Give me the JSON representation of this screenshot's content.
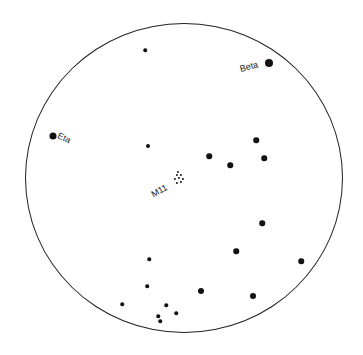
{
  "chart_data": {
    "type": "scatter",
    "title": "",
    "field_circle": {
      "cx": 184,
      "cy": 178,
      "rx": 159,
      "ry": 155
    },
    "labels": [
      {
        "text": "Beta",
        "x": 240,
        "y": 70,
        "rotate": -15
      },
      {
        "text": "Eta",
        "x": 58,
        "y": 136,
        "rotate": 25
      },
      {
        "text": "M11",
        "x": 152,
        "y": 196,
        "rotate": -30
      }
    ],
    "stars": [
      {
        "x": 145,
        "y": 50,
        "size": 3.5
      },
      {
        "x": 269,
        "y": 63,
        "size": 8
      },
      {
        "x": 53,
        "y": 136,
        "size": 7
      },
      {
        "x": 148,
        "y": 146,
        "size": 4
      },
      {
        "x": 256,
        "y": 140,
        "size": 5.5
      },
      {
        "x": 209,
        "y": 156,
        "size": 5.5
      },
      {
        "x": 264,
        "y": 158,
        "size": 5.5
      },
      {
        "x": 230,
        "y": 165,
        "size": 5.5
      },
      {
        "x": 262,
        "y": 223,
        "size": 5.5
      },
      {
        "x": 236,
        "y": 251,
        "size": 5.5
      },
      {
        "x": 301,
        "y": 261,
        "size": 5.5
      },
      {
        "x": 149,
        "y": 259,
        "size": 3.5
      },
      {
        "x": 147,
        "y": 286,
        "size": 3.5
      },
      {
        "x": 201,
        "y": 291,
        "size": 6
      },
      {
        "x": 253,
        "y": 296,
        "size": 6
      },
      {
        "x": 122,
        "y": 304,
        "size": 3.5
      },
      {
        "x": 166,
        "y": 305,
        "size": 3.5
      },
      {
        "x": 176,
        "y": 313,
        "size": 3.5
      },
      {
        "x": 158,
        "y": 316,
        "size": 3.5
      },
      {
        "x": 160,
        "y": 321,
        "size": 3.5
      }
    ],
    "cluster_M11": [
      {
        "x": 177,
        "y": 175
      },
      {
        "x": 181,
        "y": 175
      },
      {
        "x": 175,
        "y": 179
      },
      {
        "x": 179,
        "y": 178
      },
      {
        "x": 183,
        "y": 179
      },
      {
        "x": 177,
        "y": 183
      },
      {
        "x": 181,
        "y": 182
      },
      {
        "x": 178,
        "y": 172
      }
    ]
  }
}
